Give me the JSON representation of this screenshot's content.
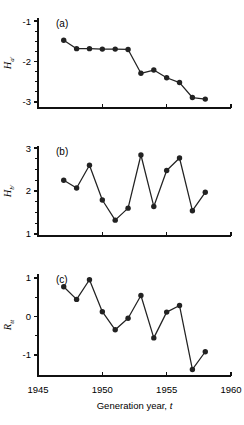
{
  "figure": {
    "xlabel_text": "Generation year, ",
    "xlabel_italic": "t",
    "x_ticks": [
      "1945",
      "1950",
      "1955",
      "1960"
    ],
    "x_tick_values": [
      1945,
      1950,
      1955,
      1960
    ],
    "x_range": [
      1945,
      1960
    ],
    "x_minor_step": 1,
    "marker_color": "#222222",
    "line_color": "#222222",
    "axis_color": "#111111"
  },
  "chart_data": [
    {
      "type": "line",
      "panel": "a",
      "panel_label": "(a)",
      "title": "",
      "xlabel": "Generation year, t",
      "ylabel": "H_a'",
      "ylabel_base": "H",
      "ylabel_sub": "a'",
      "y_ticks": [
        "-1",
        "-2",
        "-3"
      ],
      "y_tick_values": [
        -1,
        -2,
        -3
      ],
      "ylim": [
        -3.15,
        -0.92
      ],
      "y_minor_step": 0.25,
      "grid": false,
      "legend": "none",
      "x": [
        1947,
        1948,
        1949,
        1950,
        1951,
        1952,
        1953,
        1954,
        1955,
        1956,
        1957,
        1958
      ],
      "values": [
        -1.47,
        -1.68,
        -1.68,
        -1.69,
        -1.69,
        -1.7,
        -2.29,
        -2.21,
        -2.4,
        -2.52,
        -2.89,
        -2.93
      ]
    },
    {
      "type": "line",
      "panel": "b",
      "panel_label": "(b)",
      "title": "",
      "xlabel": "Generation year, t",
      "ylabel": "H_b'",
      "ylabel_base": "H",
      "ylabel_sub": "b'",
      "y_ticks": [
        "3",
        "2",
        "1"
      ],
      "y_tick_values": [
        3,
        2,
        1
      ],
      "ylim": [
        0.95,
        3.05
      ],
      "y_minor_step": 0.25,
      "grid": false,
      "legend": "none",
      "x": [
        1947,
        1948,
        1949,
        1950,
        1951,
        1952,
        1953,
        1954,
        1955,
        1956,
        1957,
        1958
      ],
      "values": [
        2.25,
        2.07,
        2.6,
        1.79,
        1.32,
        1.6,
        2.84,
        1.64,
        2.48,
        2.77,
        1.54,
        1.97
      ]
    },
    {
      "type": "line",
      "panel": "c",
      "panel_label": "(c)",
      "title": "",
      "xlabel": "Generation year, t",
      "ylabel": "R_tt",
      "ylabel_base": "R",
      "ylabel_sub": "tt",
      "y_ticks": [
        "1",
        "0",
        "-1"
      ],
      "y_tick_values": [
        1,
        0,
        -1
      ],
      "ylim": [
        -1.55,
        1.1
      ],
      "y_minor_step": 0.5,
      "grid": false,
      "legend": "none",
      "x": [
        1947,
        1948,
        1949,
        1950,
        1951,
        1952,
        1953,
        1954,
        1955,
        1956,
        1957,
        1958
      ],
      "values": [
        0.77,
        0.44,
        0.95,
        0.12,
        -0.35,
        -0.05,
        0.54,
        -0.56,
        0.11,
        0.28,
        -1.38,
        -0.92
      ]
    }
  ]
}
